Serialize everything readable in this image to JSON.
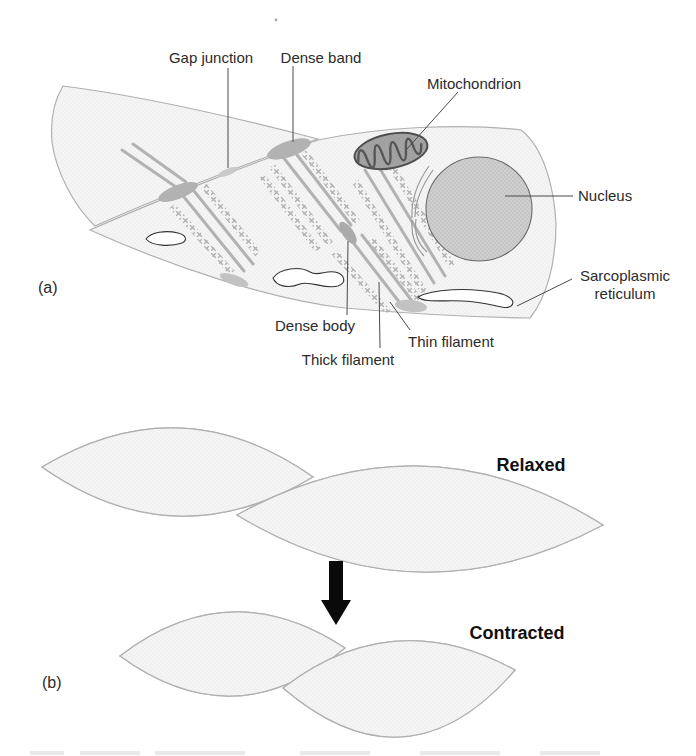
{
  "figure": {
    "panel_a": {
      "label": "(a)",
      "annotations": {
        "gap_junction": "Gap junction",
        "dense_band": "Dense band",
        "mitochondrion": "Mitochondrion",
        "nucleus": "Nucleus",
        "sarcoplasmic_line1": "Sarcoplasmic",
        "sarcoplasmic_line2": "reticulum",
        "dense_body": "Dense body",
        "thick_filament": "Thick filament",
        "thin_filament": "Thin filament"
      }
    },
    "panel_b": {
      "label": "(b)",
      "state_relaxed": "Relaxed",
      "state_contracted": "Contracted"
    },
    "colors": {
      "cell_fill": "#f2f2f2",
      "organelle_gray": "#a8a8a8",
      "nucleus_gray": "#c9c9c9",
      "band_gray": "#b2b2b2",
      "label_text": "#2b2b2b",
      "arrow_black": "#0a0a0a"
    }
  }
}
